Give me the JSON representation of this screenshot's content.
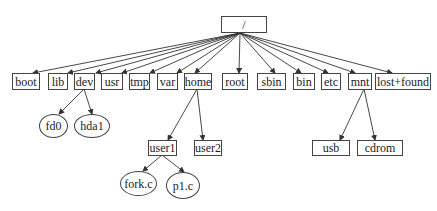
{
  "diagram": {
    "root": {
      "label": "/"
    },
    "level1": [
      {
        "id": "boot",
        "label": "boot"
      },
      {
        "id": "lib",
        "label": "lib"
      },
      {
        "id": "dev",
        "label": "dev"
      },
      {
        "id": "usr",
        "label": "usr"
      },
      {
        "id": "tmp",
        "label": "tmp"
      },
      {
        "id": "var",
        "label": "var"
      },
      {
        "id": "home",
        "label": "home"
      },
      {
        "id": "root",
        "label": "root"
      },
      {
        "id": "sbin",
        "label": "sbin"
      },
      {
        "id": "bin",
        "label": "bin"
      },
      {
        "id": "etc",
        "label": "etc"
      },
      {
        "id": "mnt",
        "label": "mnt"
      },
      {
        "id": "lost_found",
        "label": "lost+found"
      }
    ],
    "dev_children": [
      {
        "id": "fd0",
        "label": "fd0",
        "shape": "ellipse"
      },
      {
        "id": "hda1",
        "label": "hda1",
        "shape": "ellipse"
      }
    ],
    "home_children": [
      {
        "id": "user1",
        "label": "user1",
        "shape": "box"
      },
      {
        "id": "user2",
        "label": "user2",
        "shape": "box"
      }
    ],
    "user1_children": [
      {
        "id": "fork_c",
        "label": "fork.c",
        "shape": "ellipse"
      },
      {
        "id": "p1_c",
        "label": "p1.c",
        "shape": "ellipse"
      }
    ],
    "mnt_children": [
      {
        "id": "usb",
        "label": "usb",
        "shape": "box"
      },
      {
        "id": "cdrom",
        "label": "cdrom",
        "shape": "box"
      }
    ],
    "colors": {
      "line": "#333333",
      "border": "#444444",
      "text": "#222222",
      "background": "#ffffff"
    }
  }
}
